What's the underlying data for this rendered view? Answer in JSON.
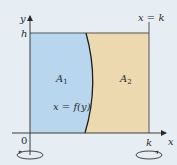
{
  "diagram": {
    "axes": {
      "x_label": "x",
      "y_label": "y",
      "origin_label": "0"
    },
    "markers": {
      "h_label": "h",
      "k_label": "k",
      "line_label": "x = k"
    },
    "regions": [
      {
        "name": "A1",
        "label": "A",
        "sub": "1",
        "color": "#b9d6ef"
      },
      {
        "name": "A2",
        "label": "A",
        "sub": "2",
        "color": "#ecd9b0"
      }
    ],
    "curve_label": "x = f(y)",
    "colors": {
      "background": "#e7eef3",
      "axis": "#3c3c3c",
      "curve": "#1e1e1e"
    }
  }
}
